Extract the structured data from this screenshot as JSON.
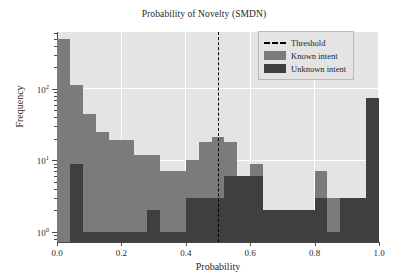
{
  "chart_data": {
    "type": "bar",
    "subtype": "histogram-overlapping",
    "title": "Probability of Novelty (SMDN)",
    "xlabel": "Probability",
    "ylabel": "Frequency",
    "xlim": [
      0.0,
      1.0
    ],
    "ylim": [
      0.72,
      620
    ],
    "yscale": "log",
    "grid": true,
    "legend_position": "upper right",
    "bin_width": 0.04,
    "xticks": [
      "0.0",
      "0.2",
      "0.4",
      "0.6",
      "0.8",
      "1.0"
    ],
    "xtick_values": [
      0.0,
      0.2,
      0.4,
      0.6,
      0.8,
      1.0
    ],
    "yticks": [
      "10^0",
      "10^1",
      "10^2"
    ],
    "ytick_values": [
      1,
      10,
      100
    ],
    "bin_starts": [
      0.0,
      0.04,
      0.08,
      0.12,
      0.16,
      0.2,
      0.24,
      0.28,
      0.32,
      0.36,
      0.4,
      0.44,
      0.48,
      0.52,
      0.56,
      0.6,
      0.64,
      0.68,
      0.72,
      0.76,
      0.8,
      0.84,
      0.88,
      0.92,
      0.96
    ],
    "series": [
      {
        "name": "Known intent",
        "color": "#7b7b7b",
        "values": [
          500,
          112,
          45,
          25,
          19,
          19,
          12,
          12,
          7,
          7,
          10,
          18,
          21,
          18,
          6,
          9,
          2,
          2,
          2,
          1,
          7,
          3,
          3,
          3,
          0
        ]
      },
      {
        "name": "Unknown intent",
        "color": "#3f3f3f",
        "values": [
          0,
          9,
          1,
          1,
          1,
          1,
          1,
          2,
          1,
          1,
          3,
          3,
          3,
          6,
          6,
          6,
          2,
          2,
          2,
          2,
          3,
          1,
          3,
          3,
          75
        ]
      }
    ],
    "annotations": [
      {
        "name": "Threshold",
        "type": "vline",
        "x": 0.5,
        "color": "#000000",
        "linestyle": "dashed"
      }
    ]
  },
  "legend": {
    "items": [
      {
        "label": "Threshold",
        "key": "dashed-line-key"
      },
      {
        "label": "Known intent",
        "key": "known-swatch"
      },
      {
        "label": "Unknown intent",
        "key": "unknown-swatch"
      }
    ]
  },
  "colors": {
    "plot_background": "#e4e4e4",
    "grid": "#ffffff",
    "known": "#7b7b7b",
    "unknown": "#3f3f3f",
    "threshold": "#000000",
    "figure_background": "#ffffff"
  },
  "yticklabels": [
    {
      "mantissa": "10",
      "exponent": "0"
    },
    {
      "mantissa": "10",
      "exponent": "1"
    },
    {
      "mantissa": "10",
      "exponent": "2"
    }
  ]
}
